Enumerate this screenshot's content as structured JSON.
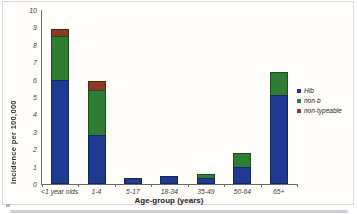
{
  "chart_data": {
    "type": "bar",
    "stacked": true,
    "title": "",
    "xlabel": "Age-group (years)",
    "ylabel": "Incidence per 100,000",
    "ylim": [
      0,
      10
    ],
    "yticks": [
      0,
      1,
      2,
      3,
      4,
      5,
      6,
      7,
      8,
      9,
      10
    ],
    "grid": false,
    "legend_position": "right",
    "categories": [
      "<1 year olds",
      "1-4",
      "5-17",
      "18-34",
      "35-49",
      "50-64",
      "65+"
    ],
    "series": [
      {
        "name": "Hib",
        "color": "#1f3a93",
        "values": [
          6.0,
          2.8,
          0.35,
          0.45,
          0.35,
          1.0,
          5.1
        ]
      },
      {
        "name": "non-b",
        "color": "#2e7d33",
        "values": [
          2.5,
          2.6,
          0,
          0,
          0.25,
          0.8,
          1.35
        ]
      },
      {
        "name": "non-typeable",
        "color": "#8a3a20",
        "values": [
          0.4,
          0.5,
          0,
          0,
          0,
          0,
          0
        ]
      }
    ]
  },
  "colors": {
    "figure_background": "#fffefa",
    "figure_border": "#d9d9e1",
    "axis_line": "#6a6a6a",
    "text": "#333333",
    "shadow": "#cdcdd3"
  }
}
